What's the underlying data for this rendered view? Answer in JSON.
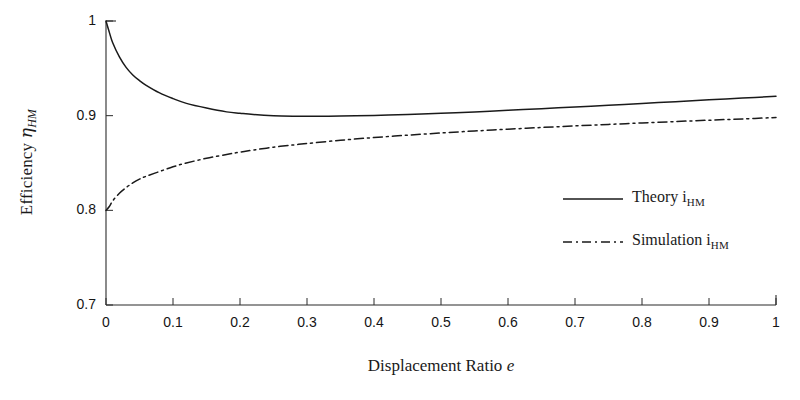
{
  "figure": {
    "background": "#ffffff",
    "line_color": "#1a1a1a",
    "axis_color": "#2b2b2b"
  },
  "axis": {
    "y_title_prefix": "Efficiency ",
    "y_title_symbol": "η",
    "y_title_sub": "HM",
    "x_title_prefix": "Displacement Ratio ",
    "x_title_symbol": "e",
    "y_ticks": [
      "0.7",
      "0.8",
      "0.9",
      "1"
    ],
    "x_ticks": [
      "0",
      "0.1",
      "0.2",
      "0.3",
      "0.4",
      "0.5",
      "0.6",
      "0.7",
      "0.8",
      "0.9",
      "1"
    ]
  },
  "legend": {
    "items": [
      {
        "label_main": "Theory i",
        "label_sub": "HM",
        "style": "solid"
      },
      {
        "label_main": "Simulation i",
        "label_sub": "HM",
        "style": "dashdot"
      }
    ]
  },
  "chart_data": {
    "type": "line",
    "title": "",
    "xlabel": "Displacement Ratio e",
    "ylabel": "Efficiency ηHM",
    "xlim": [
      0,
      1
    ],
    "ylim": [
      0.7,
      1.0
    ],
    "xticks": [
      0,
      0.1,
      0.2,
      0.3,
      0.4,
      0.5,
      0.6,
      0.7,
      0.8,
      0.9,
      1
    ],
    "yticks": [
      0.7,
      0.8,
      0.9,
      1.0
    ],
    "grid": false,
    "legend_position": "center-right",
    "x": [
      0.0,
      0.005,
      0.01,
      0.02,
      0.03,
      0.04,
      0.05,
      0.06,
      0.08,
      0.1,
      0.12,
      0.15,
      0.18,
      0.2,
      0.22,
      0.25,
      0.28,
      0.3,
      0.35,
      0.4,
      0.45,
      0.5,
      0.55,
      0.6,
      0.65,
      0.7,
      0.75,
      0.8,
      0.85,
      0.9,
      0.95,
      1.0
    ],
    "series": [
      {
        "name": "Theory iHM",
        "style": "solid",
        "values": [
          1.0,
          0.988,
          0.977,
          0.962,
          0.951,
          0.943,
          0.937,
          0.932,
          0.924,
          0.918,
          0.913,
          0.908,
          0.904,
          0.9025,
          0.9012,
          0.9,
          0.8995,
          0.8994,
          0.8996,
          0.9002,
          0.9012,
          0.9025,
          0.904,
          0.9056,
          0.9074,
          0.9092,
          0.911,
          0.9129,
          0.9148,
          0.9167,
          0.9186,
          0.9205
        ]
      },
      {
        "name": "Simulation iHM",
        "style": "dashdot",
        "values": [
          0.8,
          0.804,
          0.81,
          0.818,
          0.824,
          0.829,
          0.833,
          0.836,
          0.841,
          0.846,
          0.85,
          0.855,
          0.859,
          0.8615,
          0.8637,
          0.8667,
          0.8691,
          0.8706,
          0.874,
          0.8769,
          0.8794,
          0.8817,
          0.8838,
          0.8857,
          0.8875,
          0.8892,
          0.8908,
          0.8923,
          0.8938,
          0.8952,
          0.8966,
          0.898
        ]
      }
    ]
  }
}
